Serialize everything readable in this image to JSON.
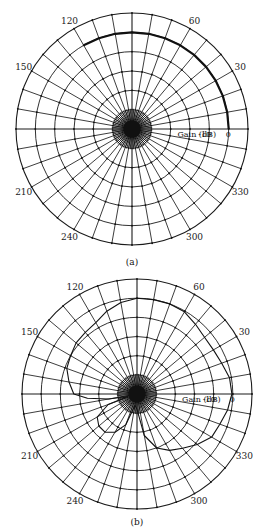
{
  "chart_data": [
    {
      "type": "polar",
      "title": "",
      "caption": "(a)",
      "center": [
        132,
        129
      ],
      "radius": 116,
      "rings": 6,
      "spoke_step_deg": 10,
      "angle_labels": [
        {
          "deg": 30,
          "text": "30"
        },
        {
          "deg": 60,
          "text": "60"
        },
        {
          "deg": 120,
          "text": "120"
        },
        {
          "deg": 150,
          "text": "150"
        },
        {
          "deg": 210,
          "text": "210"
        },
        {
          "deg": 240,
          "text": "240"
        },
        {
          "deg": 300,
          "text": "300"
        },
        {
          "deg": 330,
          "text": "330"
        }
      ],
      "radial_axis": {
        "label": "Gain (dB)",
        "ticks": [
          {
            "ring": 4,
            "text": "-10"
          },
          {
            "ring": 5,
            "text": "0"
          }
        ]
      },
      "series": [
        {
          "name": "pattern",
          "stroke": "#111111",
          "width": 2.2,
          "points_deg_gain": [
            [
              0,
              0
            ],
            [
              10,
              0
            ],
            [
              20,
              0
            ],
            [
              30,
              0
            ],
            [
              40,
              0
            ],
            [
              50,
              0
            ],
            [
              60,
              0
            ],
            [
              70,
              0
            ],
            [
              80,
              0
            ],
            [
              90,
              0
            ],
            [
              100,
              0
            ],
            [
              110,
              0
            ],
            [
              120,
              0
            ]
          ]
        }
      ]
    },
    {
      "type": "polar",
      "title": "",
      "caption": "(b)",
      "center": [
        137,
        128
      ],
      "radius": 115,
      "rings": 6,
      "spoke_step_deg": 10,
      "angle_labels": [
        {
          "deg": 30,
          "text": "30"
        },
        {
          "deg": 60,
          "text": "60"
        },
        {
          "deg": 120,
          "text": "120"
        },
        {
          "deg": 150,
          "text": "150"
        },
        {
          "deg": 210,
          "text": "210"
        },
        {
          "deg": 240,
          "text": "240"
        },
        {
          "deg": 300,
          "text": "300"
        },
        {
          "deg": 330,
          "text": "330"
        }
      ],
      "radial_axis": {
        "label": "Gain (dB)",
        "ticks": [
          {
            "ring": 4,
            "text": "-10"
          },
          {
            "ring": 5,
            "text": "0"
          }
        ]
      },
      "series": [
        {
          "name": "pattern",
          "stroke": "#111111",
          "width": 1.1,
          "points_ring": [
            [
              0,
              4.95
            ],
            [
              10,
              4.9
            ],
            [
              20,
              4.7
            ],
            [
              30,
              4.6
            ],
            [
              40,
              4.6
            ],
            [
              50,
              4.75
            ],
            [
              60,
              4.95
            ],
            [
              70,
              5.0
            ],
            [
              80,
              5.0
            ],
            [
              90,
              5.0
            ],
            [
              100,
              4.85
            ],
            [
              110,
              4.6
            ],
            [
              120,
              4.3
            ],
            [
              130,
              4.2
            ],
            [
              140,
              4.15
            ],
            [
              150,
              4.0
            ],
            [
              160,
              3.9
            ],
            [
              170,
              3.6
            ],
            [
              180,
              3.3
            ],
            [
              185,
              2.6
            ],
            [
              190,
              1.5
            ],
            [
              195,
              0.5
            ],
            [
              200,
              1.6
            ],
            [
              210,
              2.4
            ],
            [
              220,
              2.6
            ],
            [
              230,
              2.6
            ],
            [
              240,
              2.3
            ],
            [
              250,
              1.7
            ],
            [
              260,
              0.6
            ],
            [
              270,
              0.8
            ],
            [
              280,
              2.2
            ],
            [
              290,
              3.0
            ],
            [
              300,
              3.4
            ],
            [
              310,
              3.7
            ],
            [
              320,
              4.1
            ],
            [
              330,
              4.5
            ],
            [
              340,
              4.6
            ],
            [
              350,
              4.8
            ],
            [
              360,
              4.95
            ]
          ]
        }
      ]
    }
  ]
}
